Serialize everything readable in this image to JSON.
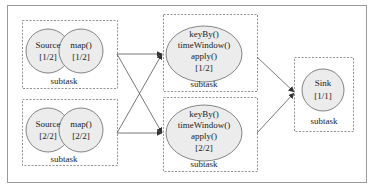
{
  "diagram": {
    "colors": {
      "background": "#ffffff",
      "outer_border": "#9a9a9a",
      "dashed_border": "#777777",
      "node_fill": "#ececec",
      "node_stroke": "#666666",
      "edge": "#555555",
      "text": "#222222"
    },
    "groups": [
      {
        "id": "source-map-1",
        "label": "subtask",
        "nodes": [
          {
            "id": "source-1",
            "lines": [
              "Source",
              "[1/2]"
            ]
          },
          {
            "id": "map-1",
            "lines": [
              "map()",
              "[1/2]"
            ]
          }
        ]
      },
      {
        "id": "source-map-2",
        "label": "subtask",
        "nodes": [
          {
            "id": "source-2",
            "lines": [
              "Source",
              "[2/2]"
            ]
          },
          {
            "id": "map-2",
            "lines": [
              "map()",
              "[2/2]"
            ]
          }
        ]
      },
      {
        "id": "window-1",
        "label": "subtask",
        "nodes": [
          {
            "id": "keyby-1",
            "lines": [
              "keyBy()",
              "timeWindow()",
              "apply()",
              "[1/2]"
            ]
          }
        ]
      },
      {
        "id": "window-2",
        "label": "subtask",
        "nodes": [
          {
            "id": "keyby-2",
            "lines": [
              "keyBy()",
              "timeWindow()",
              "apply()",
              "[2/2]"
            ]
          }
        ]
      },
      {
        "id": "sink",
        "label": "subtask",
        "nodes": [
          {
            "id": "sink-1",
            "lines": [
              "Sink",
              "[1/1]"
            ]
          }
        ]
      }
    ],
    "edges": [
      {
        "from": "source-map-1",
        "to": "window-1"
      },
      {
        "from": "source-map-1",
        "to": "window-2"
      },
      {
        "from": "source-map-2",
        "to": "window-1"
      },
      {
        "from": "source-map-2",
        "to": "window-2"
      },
      {
        "from": "window-1",
        "to": "sink"
      },
      {
        "from": "window-2",
        "to": "sink"
      }
    ]
  }
}
